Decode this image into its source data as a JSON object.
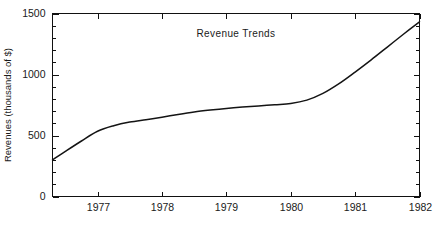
{
  "chart_data": {
    "type": "line",
    "title": "Revenue Trends",
    "xlabel": "",
    "ylabel": "Revenues (thousands of $)",
    "xlim": [
      1976.3,
      1982.0
    ],
    "ylim": [
      0,
      1500
    ],
    "grid": false,
    "legend": null,
    "y_ticks_major": [
      0,
      500,
      1000,
      1500
    ],
    "y_tick_labels": [
      "0",
      "500",
      "1000",
      "1500"
    ],
    "y_ticks_minor": [
      100,
      200,
      300,
      400,
      600,
      700,
      800,
      900,
      1100,
      1200,
      1300,
      1400
    ],
    "x_ticks": [
      1977,
      1978,
      1979,
      1980,
      1981,
      1982
    ],
    "x_tick_labels": [
      "1977",
      "1978",
      "1979",
      "1980",
      "1981",
      "1982"
    ],
    "line_color": "#141414",
    "background_color": "#ffffff",
    "series": [
      {
        "name": "Revenue",
        "x": [
          1976.3,
          1976.5,
          1976.75,
          1977.0,
          1977.25,
          1977.5,
          1977.75,
          1978.0,
          1978.25,
          1978.5,
          1978.75,
          1979.0,
          1979.25,
          1979.5,
          1979.75,
          1980.0,
          1980.25,
          1980.5,
          1980.75,
          1981.0,
          1981.25,
          1981.5,
          1981.75,
          1982.0
        ],
        "y": [
          300,
          370,
          455,
          535,
          580,
          610,
          630,
          650,
          672,
          692,
          708,
          722,
          733,
          742,
          752,
          762,
          790,
          845,
          925,
          1020,
          1120,
          1225,
          1330,
          1432
        ]
      }
    ]
  },
  "labels": {
    "title": "Revenue Trends",
    "y_axis_title": "Revenues (thousands of $)"
  }
}
